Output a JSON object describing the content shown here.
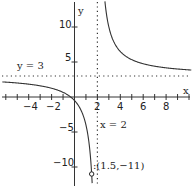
{
  "chart_data": {
    "type": "line",
    "title": "",
    "function": "f(x) = 3 + 7/(x - 2)",
    "xlabel": "x",
    "ylabel": "y",
    "xlim": [
      -6.3,
      10.2
    ],
    "ylim": [
      -12.3,
      13.8
    ],
    "x_ticks": [
      -4,
      -2,
      2,
      4,
      6,
      8
    ],
    "y_ticks": [
      10,
      5,
      -5,
      -10
    ],
    "asymptotes": [
      {
        "type": "horizontal",
        "value": 3,
        "label": "y = 3"
      },
      {
        "type": "vertical",
        "value": 2,
        "label": "x = 2"
      }
    ],
    "annotations": [
      {
        "x": 1.5,
        "y": -11,
        "label": "(1.5,−11)"
      }
    ],
    "grid": false
  },
  "labels": {
    "x_axis": "x",
    "y_axis": "y",
    "h_asymptote": "y = 3",
    "v_asymptote": "x = 2",
    "point": ":(1.5,−11)",
    "ticks_x": [
      "−4",
      "−2",
      "2",
      "4",
      "6",
      "8"
    ],
    "ticks_y": [
      "10",
      "5",
      "−5",
      "−10"
    ]
  }
}
